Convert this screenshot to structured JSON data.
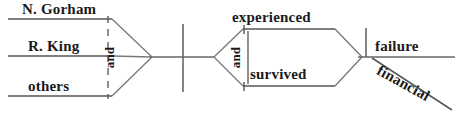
{
  "diagram": {
    "type": "reed-kellogg-sentence-diagram",
    "ink_color": "#1a1a1a",
    "rule_color": "#555555",
    "background": "#ffffff",
    "subjects": [
      {
        "text": "N. Gorham"
      },
      {
        "text": "R. King"
      },
      {
        "text": "others"
      }
    ],
    "subject_conjunction": {
      "text": "and"
    },
    "verbs": [
      {
        "text": "experienced"
      },
      {
        "text": "survived"
      }
    ],
    "verb_conjunction": {
      "text": "and"
    },
    "object": {
      "text": "failure"
    },
    "object_modifier": {
      "text": "financial"
    }
  }
}
